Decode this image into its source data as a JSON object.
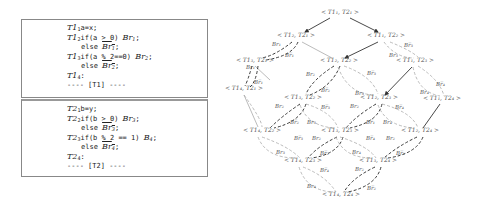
{
  "thread1": {
    "lines": [
      {
        "label": "T1",
        "sub": "1",
        "code": "a=x;"
      },
      {
        "label": "T1",
        "sub": "2",
        "code": "if(a > 0) ",
        "branch": "Br",
        "bsub": "1",
        "end": ";"
      },
      {
        "indent": true,
        "code": "else ",
        "branch": "Br",
        "bsub": "1",
        "negated": true,
        "end": ";"
      },
      {
        "label": "T1",
        "sub": "3",
        "code": "if(a % 2==0) ",
        "branch": "Br",
        "bsub": "2",
        "end": ";"
      },
      {
        "indent": true,
        "code": "else ",
        "branch": "Br",
        "bsub": "2",
        "negated": true,
        "end": ";"
      },
      {
        "label": "T1",
        "sub": "4",
        "code": ":"
      },
      {
        "code": "---- [T1] ----"
      }
    ]
  },
  "thread2": {
    "lines": [
      {
        "label": "T2",
        "sub": "1",
        "code": "b=y;"
      },
      {
        "label": "T2",
        "sub": "2",
        "code": "if(b > 0) ",
        "branch": "Br",
        "bsub": "3",
        "end": ";"
      },
      {
        "indent": true,
        "code": "else ",
        "branch": "Br",
        "bsub": "3",
        "negated": true,
        "end": ";"
      },
      {
        "label": "T2",
        "sub": "3",
        "code": "if(b % 2 == 1) ",
        "branch": "B",
        "bsub": "4",
        "end": ";"
      },
      {
        "indent": true,
        "code": "else ",
        "branch": "Br",
        "bsub": "4",
        "negated": true,
        "end": ";"
      },
      {
        "label": "T2",
        "sub": "4",
        "code": ":"
      },
      {
        "code": "---- [T2] ----"
      }
    ]
  },
  "graph": {
    "nodes": [
      {
        "id": "n11",
        "text": "< T1₁, T2₁ >",
        "x": 340,
        "y": 14
      },
      {
        "id": "n21",
        "text": "< T1₂, T2₁ >",
        "x": 296,
        "y": 37
      },
      {
        "id": "n12",
        "text": "< T1₁, T2₂ >",
        "x": 386,
        "y": 37
      },
      {
        "id": "n31",
        "text": "< T1₃, T2₁ >",
        "x": 255,
        "y": 62
      },
      {
        "id": "n22",
        "text": "< T1₂, T2₂ >",
        "x": 339,
        "y": 62
      },
      {
        "id": "n13",
        "text": "< T1₁, T2₃ >",
        "x": 415,
        "y": 62
      },
      {
        "id": "n41",
        "text": "< T1₄, T2₁ >",
        "x": 244,
        "y": 90
      },
      {
        "id": "n32",
        "text": "< T1₃, T2₂ >",
        "x": 303,
        "y": 99
      },
      {
        "id": "n23",
        "text": "< T1₂, T2₃ >",
        "x": 379,
        "y": 99
      },
      {
        "id": "n14",
        "text": "< T1₁, T2₄ >",
        "x": 442,
        "y": 100
      },
      {
        "id": "n42",
        "text": "< T1₄, T2₂ >",
        "x": 262,
        "y": 132
      },
      {
        "id": "n33",
        "text": "< T1₃, T2₃ >",
        "x": 340,
        "y": 132
      },
      {
        "id": "n24",
        "text": "< T1₂, T2₄ >",
        "x": 420,
        "y": 132
      },
      {
        "id": "n43",
        "text": "< T1₄, T2₃ >",
        "x": 303,
        "y": 162
      },
      {
        "id": "n34",
        "text": "< T1₃, T2₄ >",
        "x": 378,
        "y": 162
      },
      {
        "id": "n44",
        "text": "< T1₄, T2₄ >",
        "x": 341,
        "y": 196
      }
    ],
    "edge_labels": [
      {
        "text": "Br₁",
        "x": 272,
        "y": 46
      },
      {
        "text": "Br̅₁",
        "x": 285,
        "y": 57
      },
      {
        "text": "Br̅₃",
        "x": 404,
        "y": 47
      },
      {
        "text": "Br₃",
        "x": 389,
        "y": 57
      },
      {
        "text": "Br₁",
        "x": 246,
        "y": 69
      },
      {
        "text": "Br̅₁",
        "x": 254,
        "y": 84
      },
      {
        "text": "Br₂",
        "x": 306,
        "y": 76
      },
      {
        "text": "Br̅₂",
        "x": 321,
        "y": 92
      },
      {
        "text": "Br̅₃",
        "x": 367,
        "y": 75
      },
      {
        "text": "Br₃",
        "x": 355,
        "y": 95
      },
      {
        "text": "Br̅₄",
        "x": 436,
        "y": 86
      },
      {
        "text": "Br₄",
        "x": 420,
        "y": 94
      },
      {
        "text": "Br₂",
        "x": 275,
        "y": 108
      },
      {
        "text": "Br̅₃",
        "x": 321,
        "y": 109
      },
      {
        "text": "Br̅₂",
        "x": 290,
        "y": 124
      },
      {
        "text": "Br₃",
        "x": 307,
        "y": 124
      },
      {
        "text": "Br₂",
        "x": 350,
        "y": 108
      },
      {
        "text": "Br̅₁",
        "x": 366,
        "y": 124
      },
      {
        "text": "Br₄",
        "x": 383,
        "y": 124
      },
      {
        "text": "Br̅₄",
        "x": 395,
        "y": 109
      },
      {
        "text": "Br̅₃",
        "x": 294,
        "y": 140
      },
      {
        "text": "Br₂",
        "x": 312,
        "y": 140
      },
      {
        "text": "Br̅₄",
        "x": 366,
        "y": 140
      },
      {
        "text": "Br₂",
        "x": 386,
        "y": 140
      },
      {
        "text": "Br₃",
        "x": 276,
        "y": 154
      },
      {
        "text": "Br̅₂",
        "x": 320,
        "y": 155
      },
      {
        "text": "Br₄",
        "x": 352,
        "y": 154
      },
      {
        "text": "Br̅₁",
        "x": 396,
        "y": 155
      },
      {
        "text": "Br̅₄",
        "x": 320,
        "y": 172
      },
      {
        "text": "Br₂",
        "x": 355,
        "y": 171
      },
      {
        "text": "Br₄",
        "x": 307,
        "y": 188
      },
      {
        "text": "Br̅₂",
        "x": 367,
        "y": 190
      }
    ]
  }
}
